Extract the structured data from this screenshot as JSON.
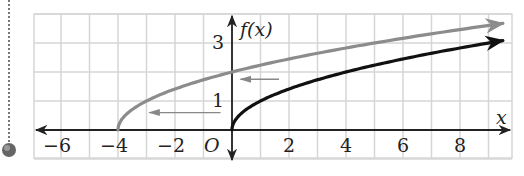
{
  "chart_data": {
    "type": "line",
    "title": "",
    "xlabel": "x",
    "ylabel": "f(x)",
    "origin_label": "O",
    "xlim": [
      -7,
      10
    ],
    "ylim": [
      -1,
      4
    ],
    "grid": true,
    "x_ticks": [
      -6,
      -4,
      -2,
      2,
      4,
      6,
      8
    ],
    "x_tick_labels": [
      "−6",
      "−4",
      "−2",
      "2",
      "4",
      "6",
      "8"
    ],
    "y_ticks": [
      1,
      3
    ],
    "y_tick_labels": [
      "1",
      "3"
    ],
    "series": [
      {
        "name": "f(x) = √x",
        "color": "#111111",
        "x": [
          0,
          0.25,
          1,
          2,
          4,
          6,
          8,
          9.5
        ],
        "y": [
          0,
          0.5,
          1,
          1.41,
          2,
          2.45,
          2.83,
          3.08
        ]
      },
      {
        "name": "g(x) = √(x+4)",
        "color": "#8c8c8c",
        "x": [
          -4,
          -3.75,
          -3,
          -2,
          0,
          2,
          4,
          6,
          8,
          9.5
        ],
        "y": [
          0,
          0.5,
          1,
          1.41,
          2,
          2.45,
          2.83,
          3.16,
          3.46,
          3.67
        ]
      }
    ],
    "annotations": [
      {
        "type": "arrow",
        "from": [
          1.65,
          1.75
        ],
        "to": [
          0.3,
          1.75
        ],
        "note": "shift left 4"
      },
      {
        "type": "arrow",
        "from": [
          -0.4,
          0.6
        ],
        "to": [
          -2.9,
          0.6
        ],
        "note": "shift left 4"
      }
    ]
  }
}
